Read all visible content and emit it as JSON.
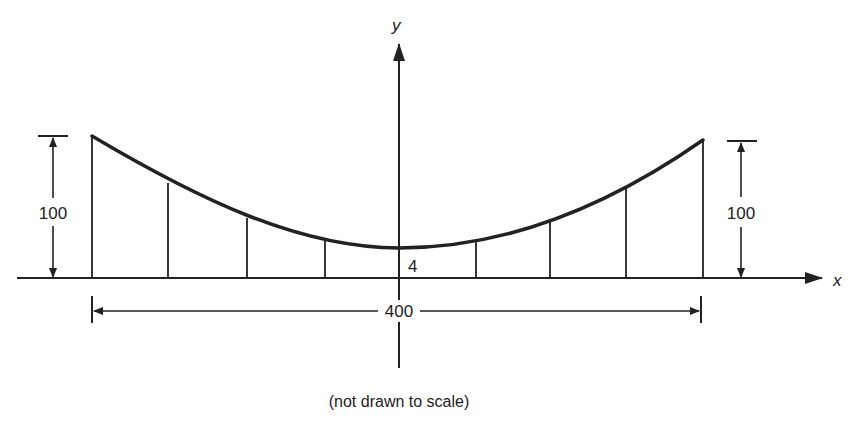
{
  "diagram": {
    "axes": {
      "x_label": "x",
      "y_label": "y"
    },
    "dimensions": {
      "left_height": "100",
      "right_height": "100",
      "span": "400",
      "sag_at_center": "4"
    },
    "caption": "(not drawn to scale)",
    "colors": {
      "line": "#222222",
      "background": "#ffffff"
    },
    "geometry": {
      "baseline_y": 278,
      "y_axis_x": 399,
      "hanger_x": [
        92,
        168,
        247,
        325,
        476,
        550,
        626,
        703
      ],
      "hanger_top_y": [
        136,
        183,
        218,
        241,
        242,
        219,
        187,
        140
      ],
      "center_top_y": 248
    }
  }
}
